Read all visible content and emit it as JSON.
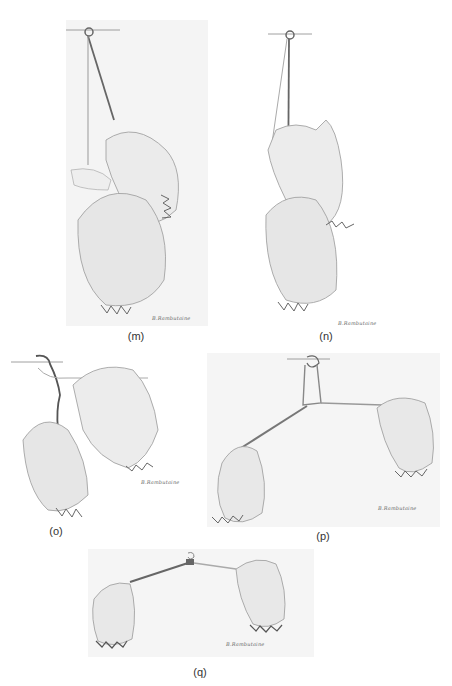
{
  "figure": {
    "panels": [
      {
        "id": "m",
        "label": "(m)",
        "signature": "B.Rambutaine",
        "description": "two hands holding suture near hook; one hand loops strand over finger"
      },
      {
        "id": "n",
        "label": "(n)",
        "signature": "B.Rambutaine",
        "description": "two hands; upper hand loops strand around fingers below hook"
      },
      {
        "id": "o",
        "label": "(o)",
        "signature": "B.Rambutaine",
        "description": "two hands separated; strand passes through hook"
      },
      {
        "id": "p",
        "label": "(p)",
        "signature": "B.Rambutaine",
        "description": "two fists pulling strands apart forming knot under hook"
      },
      {
        "id": "q",
        "label": "(q)",
        "signature": "B.Rambutaine",
        "description": "two fists pulling strands horizontally tightening knot at hook"
      }
    ]
  },
  "colors": {
    "background": "#ffffff",
    "panel_bg": "#f3f3f3",
    "pencil": "#6e6e6e",
    "strand": "#555555",
    "glove": "#e9e9e9"
  }
}
